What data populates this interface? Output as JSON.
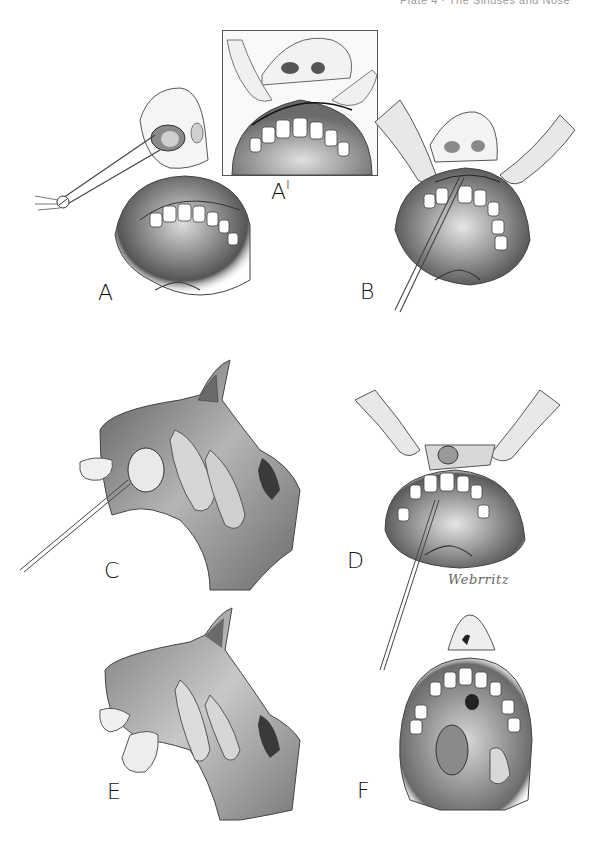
{
  "header": {
    "text": "Plate 4 · The Sinuses and Nose"
  },
  "figure": {
    "panels": [
      {
        "id": "A",
        "label": "A",
        "subject": "forceps in nostril, open mouth frontal view"
      },
      {
        "id": "A1",
        "label": "A",
        "label_superscript": "I",
        "subject": "inset: lip retracted, gingivolabial incision"
      },
      {
        "id": "B",
        "label": "B",
        "subject": "fingers retracting lip, instrument in incision"
      },
      {
        "id": "C",
        "label": "C",
        "subject": "sagittal section of nasal cavity with cyst and needle"
      },
      {
        "id": "D",
        "label": "D",
        "subject": "retracted lip showing cyst through incision, needle in palate"
      },
      {
        "id": "E",
        "label": "E",
        "subject": "sagittal section, cyst in nasal floor"
      },
      {
        "id": "F",
        "label": "F",
        "subject": "open mouth view with cyst displaced in palate"
      }
    ],
    "signature": "Webrritz"
  },
  "colors": {
    "background": "#ffffff",
    "ink": "#1a1a1a",
    "shade_dark": "#3c3c3c",
    "shade_mid": "#8a8a8a",
    "shade_light": "#d4d4d4"
  }
}
